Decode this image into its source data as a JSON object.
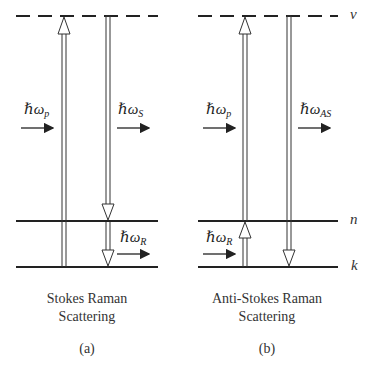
{
  "diagrams": [
    {
      "id": "a",
      "caption_line1": "Stokes Raman",
      "caption_line2": "Scattering",
      "panel_label": "(a)",
      "incoming_label": "ℏω",
      "incoming_sub": "p",
      "outgoing_label": "ℏω",
      "outgoing_sub": "S",
      "raman_label": "ℏω",
      "raman_sub": "R"
    },
    {
      "id": "b",
      "caption_line1": "Anti-Stokes Raman",
      "caption_line2": "Scattering",
      "panel_label": "(b)",
      "incoming_label": "ℏω",
      "incoming_sub": "p",
      "outgoing_label": "ℏω",
      "outgoing_sub": "AS",
      "raman_label": "ℏω",
      "raman_sub": "R"
    }
  ],
  "levels": {
    "virtual": "ν",
    "excited": "n",
    "ground": "k"
  },
  "colors": {
    "line": "#222222",
    "background": "#ffffff"
  }
}
